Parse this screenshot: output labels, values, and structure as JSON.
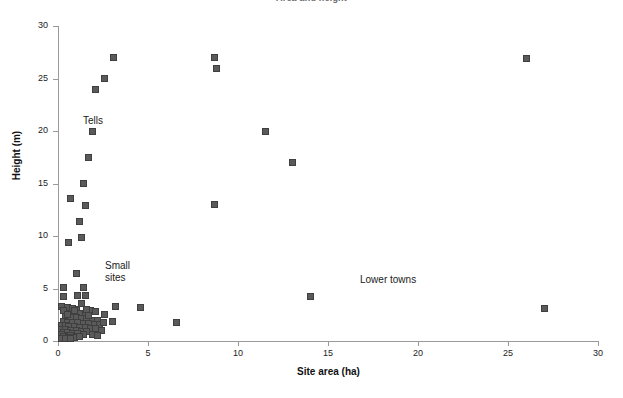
{
  "chart_data": {
    "type": "scatter",
    "title": "Area and height",
    "xlabel": "Site area (ha)",
    "ylabel": "Height (m)",
    "xlim": [
      0,
      30
    ],
    "ylim": [
      0,
      30
    ],
    "xticks": [
      0,
      5,
      10,
      15,
      20,
      25,
      30
    ],
    "yticks": [
      0,
      5,
      10,
      15,
      20,
      25,
      30
    ],
    "grid": false,
    "legend": "none",
    "marker": {
      "shape": "square",
      "fill": "#5a5a5a",
      "edge": "#3f3f3f",
      "size_px": 7
    },
    "annotations": [
      {
        "id": "tells",
        "text": "Tells",
        "x": 1.4,
        "y": 21.5
      },
      {
        "id": "small-sites",
        "text": "Small\nsites",
        "x": 2.6,
        "y": 7.7
      },
      {
        "id": "lower-towns",
        "text": "Lower towns",
        "x": 16.8,
        "y": 6.4
      }
    ],
    "points": [
      [
        3.1,
        27.0
      ],
      [
        8.7,
        27.0
      ],
      [
        26.0,
        26.9
      ],
      [
        8.8,
        26.0
      ],
      [
        2.6,
        25.0
      ],
      [
        2.1,
        24.0
      ],
      [
        1.9,
        20.0
      ],
      [
        11.5,
        20.0
      ],
      [
        1.7,
        17.5
      ],
      [
        13.0,
        17.0
      ],
      [
        1.4,
        15.0
      ],
      [
        0.7,
        13.6
      ],
      [
        8.7,
        13.0
      ],
      [
        1.5,
        12.9
      ],
      [
        1.2,
        11.4
      ],
      [
        1.3,
        9.9
      ],
      [
        0.6,
        9.4
      ],
      [
        1.0,
        6.4
      ],
      [
        0.3,
        5.1
      ],
      [
        1.4,
        5.1
      ],
      [
        1.1,
        4.3
      ],
      [
        1.5,
        4.3
      ],
      [
        0.3,
        4.2
      ],
      [
        14.0,
        4.2
      ],
      [
        1.3,
        3.6
      ],
      [
        3.2,
        3.3
      ],
      [
        4.6,
        3.2
      ],
      [
        27.0,
        3.1
      ],
      [
        1.0,
        3.0
      ],
      [
        1.8,
        2.9
      ],
      [
        2.1,
        2.8
      ],
      [
        0.6,
        2.7
      ],
      [
        0.9,
        2.6
      ],
      [
        1.2,
        2.6
      ],
      [
        1.5,
        2.5
      ],
      [
        2.6,
        2.5
      ],
      [
        6.6,
        1.8
      ],
      [
        0.4,
        2.3
      ],
      [
        0.7,
        2.2
      ],
      [
        1.0,
        2.2
      ],
      [
        1.3,
        2.1
      ],
      [
        1.6,
        2.1
      ],
      [
        1.9,
        2.0
      ],
      [
        2.2,
        2.0
      ],
      [
        3.0,
        1.9
      ],
      [
        0.3,
        1.9
      ],
      [
        0.5,
        1.8
      ],
      [
        0.8,
        1.8
      ],
      [
        1.1,
        1.8
      ],
      [
        1.4,
        1.7
      ],
      [
        1.7,
        1.7
      ],
      [
        2.0,
        1.6
      ],
      [
        2.3,
        1.6
      ],
      [
        0.2,
        1.5
      ],
      [
        0.4,
        1.5
      ],
      [
        0.6,
        1.4
      ],
      [
        0.9,
        1.4
      ],
      [
        1.2,
        1.3
      ],
      [
        1.5,
        1.3
      ],
      [
        1.8,
        1.2
      ],
      [
        2.1,
        1.2
      ],
      [
        0.2,
        1.1
      ],
      [
        0.4,
        1.1
      ],
      [
        0.7,
        1.0
      ],
      [
        1.0,
        1.0
      ],
      [
        1.3,
        0.9
      ],
      [
        1.6,
        0.9
      ],
      [
        0.3,
        0.8
      ],
      [
        0.5,
        0.8
      ],
      [
        0.8,
        0.7
      ],
      [
        1.1,
        0.7
      ],
      [
        1.4,
        0.6
      ],
      [
        0.2,
        0.6
      ],
      [
        0.5,
        0.5
      ],
      [
        0.7,
        0.5
      ],
      [
        1.0,
        0.4
      ],
      [
        0.3,
        0.4
      ],
      [
        0.6,
        0.3
      ],
      [
        0.9,
        0.3
      ],
      [
        0.2,
        0.2
      ],
      [
        0.4,
        0.2
      ],
      [
        0.7,
        0.2
      ],
      [
        1.2,
        0.4
      ],
      [
        0.2,
        3.3
      ],
      [
        0.5,
        3.2
      ],
      [
        0.8,
        3.1
      ],
      [
        2.4,
        1.0
      ],
      [
        1.9,
        0.6
      ],
      [
        0.3,
        2.9
      ],
      [
        1.6,
        3.0
      ],
      [
        2.2,
        0.5
      ],
      [
        0.5,
        2.5
      ],
      [
        0.9,
        2.9
      ],
      [
        1.7,
        2.4
      ],
      [
        2.5,
        1.8
      ]
    ]
  }
}
